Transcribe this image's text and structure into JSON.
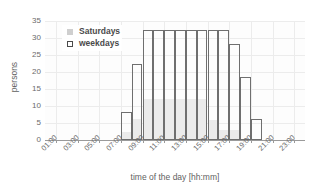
{
  "chart_data": {
    "type": "bar",
    "title": "",
    "xlabel": "time of the day [hh:mm]",
    "ylabel": "persons",
    "xtick_labels": [
      "01:00",
      "03:00",
      "05:00",
      "07:00",
      "09:00",
      "11:00",
      "13:00",
      "15:00",
      "17:00",
      "19:00",
      "21:00",
      "23:00"
    ],
    "xtick_hours": [
      1,
      3,
      5,
      7,
      9,
      11,
      13,
      15,
      17,
      19,
      21,
      23
    ],
    "ytick_labels": [
      "0",
      "5",
      "10",
      "15",
      "20",
      "25",
      "30",
      "35"
    ],
    "ylim": [
      0,
      35
    ],
    "xlim": [
      0,
      24
    ],
    "grid": true,
    "legend_position": "top-left",
    "bins": [
      "07:00",
      "08:00",
      "09:00",
      "10:00",
      "11:00",
      "12:00",
      "13:00",
      "14:00",
      "15:00",
      "16:00",
      "17:00",
      "18:00",
      "19:00",
      "20:00"
    ],
    "bin_start_hours": [
      7,
      8,
      9,
      10,
      11,
      12,
      13,
      14,
      15,
      16,
      17,
      18,
      19,
      20
    ],
    "series": [
      {
        "name": "weekdays",
        "style": "open-outline",
        "color": "#6f6f6f",
        "values": [
          8.2,
          22.4,
          32.4,
          32.4,
          32.4,
          32.4,
          32.4,
          32.4,
          32.4,
          32.4,
          28.2,
          18.5,
          6.3,
          0
        ]
      },
      {
        "name": "Saturdays",
        "style": "filled",
        "color": "#ebebeb",
        "values": [
          2.3,
          6.1,
          12.1,
          12.1,
          12.1,
          12.1,
          12.1,
          12.1,
          6.0,
          3.0,
          3.0,
          0,
          0,
          0
        ]
      }
    ]
  },
  "legend": {
    "items": [
      {
        "label": "Saturdays",
        "marker": "filled-square-icon"
      },
      {
        "label": "weekdays",
        "marker": "open-square-icon"
      }
    ]
  }
}
